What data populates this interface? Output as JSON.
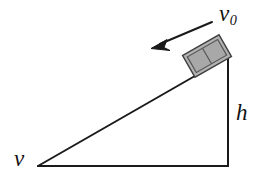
{
  "figure": {
    "type": "physics-diagram",
    "background_color": "#ffffff",
    "stroke_color": "#1a1a1a",
    "block_fill_color": "#b2b2b2",
    "block_edge_color": "#4a4a4a",
    "labels": {
      "initial_velocity": "v",
      "initial_velocity_subscript": "0",
      "height": "h",
      "final_velocity": "v"
    },
    "icons": {
      "velocity_arrow": "arrow-down-left-icon",
      "block": "block-icon",
      "incline": "right-triangle-icon"
    },
    "geometry": {
      "triangle_left_vertex": [
        38,
        166
      ],
      "triangle_bottom_right_vertex": [
        228,
        166
      ],
      "triangle_top_right_vertex": [
        228,
        57
      ],
      "arrow_tail": [
        212,
        22
      ],
      "arrow_tip": [
        152,
        48
      ],
      "block_center": [
        207,
        55
      ]
    }
  }
}
